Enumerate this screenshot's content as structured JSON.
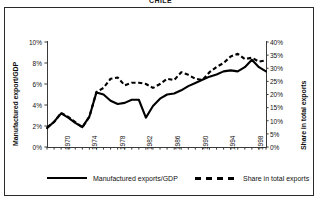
{
  "figure": {
    "title": "CHILE",
    "frame": true
  },
  "axes": {
    "left": {
      "title": "Manufactured export/GDP",
      "ticks": [
        "0%",
        "2%",
        "4%",
        "6%",
        "8%",
        "10%"
      ],
      "min": 0,
      "max": 10
    },
    "right": {
      "title": "Share in total exports",
      "ticks": [
        "0%",
        "5%",
        "10%",
        "15%",
        "20%",
        "25%",
        "30%",
        "35%",
        "40%"
      ],
      "min": 0,
      "max": 40
    },
    "bottom": {
      "ticks": [
        "1970",
        "1974",
        "1978",
        "1982",
        "1986",
        "1990",
        "1994",
        "1998"
      ],
      "min": 1968,
      "max": 1999
    }
  },
  "legend": {
    "series1_label": "Manufactured exports/GDP",
    "series2_label": "Share in total exports"
  },
  "chart_data": {
    "type": "line",
    "title": "CHILE",
    "xlabel": "",
    "ylabel": "Manufactured export/GDP",
    "ylabel_right": "Share in total exports",
    "xlim": [
      1968,
      1999
    ],
    "ylim": [
      0,
      10
    ],
    "ylim_right": [
      0,
      40
    ],
    "grid": false,
    "legend_position": "bottom",
    "x": [
      1968,
      1969,
      1970,
      1971,
      1972,
      1973,
      1974,
      1975,
      1976,
      1977,
      1978,
      1979,
      1980,
      1981,
      1982,
      1983,
      1984,
      1985,
      1986,
      1987,
      1988,
      1989,
      1990,
      1991,
      1992,
      1993,
      1994,
      1995,
      1996,
      1997,
      1998,
      1999
    ],
    "series": [
      {
        "name": "Manufactured exports/GDP",
        "axis": "left",
        "style": "solid",
        "unit": "%",
        "values": [
          1.8,
          2.4,
          3.2,
          2.8,
          2.3,
          1.9,
          2.9,
          5.2,
          5.0,
          4.4,
          4.1,
          4.2,
          4.5,
          4.5,
          2.8,
          3.9,
          4.6,
          5.0,
          5.1,
          5.4,
          5.8,
          6.1,
          6.4,
          6.7,
          6.9,
          7.2,
          7.3,
          7.2,
          7.6,
          8.3,
          7.6,
          7.2
        ]
      },
      {
        "name": "Share in total exports",
        "axis": "right",
        "style": "dashed",
        "unit": "%",
        "values": [
          7.5,
          9.5,
          13.0,
          11.5,
          9.5,
          7.5,
          11.5,
          21.0,
          22.5,
          26.0,
          26.5,
          23.5,
          24.5,
          24.5,
          24.0,
          22.5,
          24.0,
          26.0,
          25.5,
          28.5,
          27.5,
          26.0,
          25.5,
          28.5,
          30.5,
          32.0,
          34.5,
          35.5,
          33.5,
          34.0,
          32.5,
          33.0
        ]
      }
    ]
  }
}
